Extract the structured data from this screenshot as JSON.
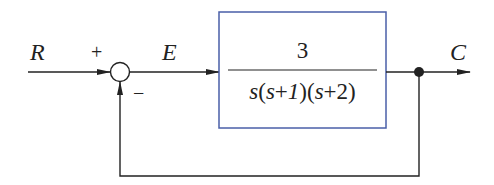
{
  "diagram": {
    "type": "closed-loop feedback block diagram",
    "signals": {
      "input": "R",
      "error": "E",
      "output": "C"
    },
    "summing_junction": {
      "plus_sign": "+",
      "minus_sign": "−"
    },
    "block": {
      "numerator": "3",
      "denominator": "s(s+1)(s+2)",
      "border_color": "#4a5fa8"
    },
    "feedback": "unity negative feedback",
    "colors": {
      "line": "#222222",
      "block_border": "#4a5fa8",
      "background": "#ffffff"
    }
  }
}
